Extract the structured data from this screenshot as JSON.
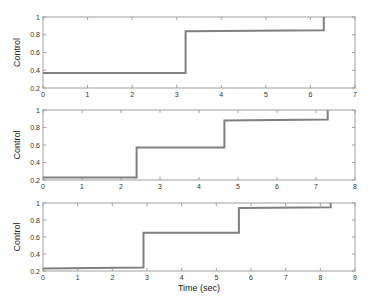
{
  "chart_data": [
    {
      "type": "line",
      "style": "step",
      "title": "",
      "xlabel": "",
      "ylabel": "Control",
      "xlim": [
        0,
        7
      ],
      "ylim": [
        0.2,
        1
      ],
      "xticks": [
        "0",
        "1",
        "2",
        "3",
        "4",
        "5",
        "6",
        "7"
      ],
      "yticks": [
        "0.2",
        "0.4",
        "0.6",
        "0.8",
        "1"
      ],
      "grid": false,
      "series": [
        {
          "name": "control",
          "x": [
            0,
            3.2,
            3.2,
            6.3,
            6.3
          ],
          "y": [
            0.37,
            0.37,
            0.84,
            0.85,
            1.0
          ]
        }
      ]
    },
    {
      "type": "line",
      "style": "step",
      "title": "",
      "xlabel": "",
      "ylabel": "Control",
      "xlim": [
        0,
        8
      ],
      "ylim": [
        0.2,
        1
      ],
      "xticks": [
        "0",
        "1",
        "2",
        "3",
        "4",
        "5",
        "6",
        "7",
        "8"
      ],
      "yticks": [
        "0.2",
        "0.4",
        "0.6",
        "0.8",
        "1"
      ],
      "grid": false,
      "series": [
        {
          "name": "control",
          "x": [
            0,
            2.4,
            2.4,
            4.65,
            4.65,
            7.3,
            7.3
          ],
          "y": [
            0.23,
            0.23,
            0.57,
            0.57,
            0.88,
            0.89,
            1.0
          ]
        }
      ]
    },
    {
      "type": "line",
      "style": "step",
      "title": "",
      "xlabel": "Time (sec)",
      "ylabel": "Control",
      "xlim": [
        0,
        9
      ],
      "ylim": [
        0.2,
        1
      ],
      "xticks": [
        "0",
        "1",
        "2",
        "3",
        "4",
        "5",
        "6",
        "7",
        "8",
        "9"
      ],
      "yticks": [
        "0.2",
        "0.4",
        "0.6",
        "0.8",
        "1"
      ],
      "grid": false,
      "series": [
        {
          "name": "control",
          "x": [
            0,
            2.9,
            2.9,
            5.65,
            5.65,
            8.3,
            8.3
          ],
          "y": [
            0.23,
            0.24,
            0.65,
            0.65,
            0.94,
            0.95,
            1.0
          ]
        }
      ]
    }
  ],
  "layout": {
    "plots": [
      {
        "left": 43,
        "top": 17,
        "width": 312,
        "height": 71
      },
      {
        "left": 43,
        "top": 110,
        "width": 312,
        "height": 70
      },
      {
        "left": 43,
        "top": 203,
        "width": 312,
        "height": 68
      }
    ],
    "line_color": "#808080",
    "axis_color": "#a0a0a0"
  }
}
